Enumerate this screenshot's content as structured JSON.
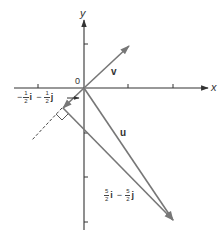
{
  "figure": {
    "origin_label": "0",
    "x_axis_label": "x",
    "y_axis_label": "y",
    "colors": {
      "axis": "#333333",
      "vector": "#777777",
      "text": "#333333"
    },
    "vectors": {
      "v": {
        "label": "v"
      },
      "u": {
        "label": "u"
      },
      "projection": {
        "sign1": "−",
        "coef1_num": "1",
        "coef1_den": "2",
        "unit1": "i",
        "op": "−",
        "coef2_num": "1",
        "coef2_den": "2",
        "unit2": "j"
      },
      "difference": {
        "coef1_num": "5",
        "coef1_den": "2",
        "unit1": "i",
        "op": "−",
        "coef2_num": "5",
        "coef2_den": "2",
        "unit2": "j"
      }
    }
  }
}
